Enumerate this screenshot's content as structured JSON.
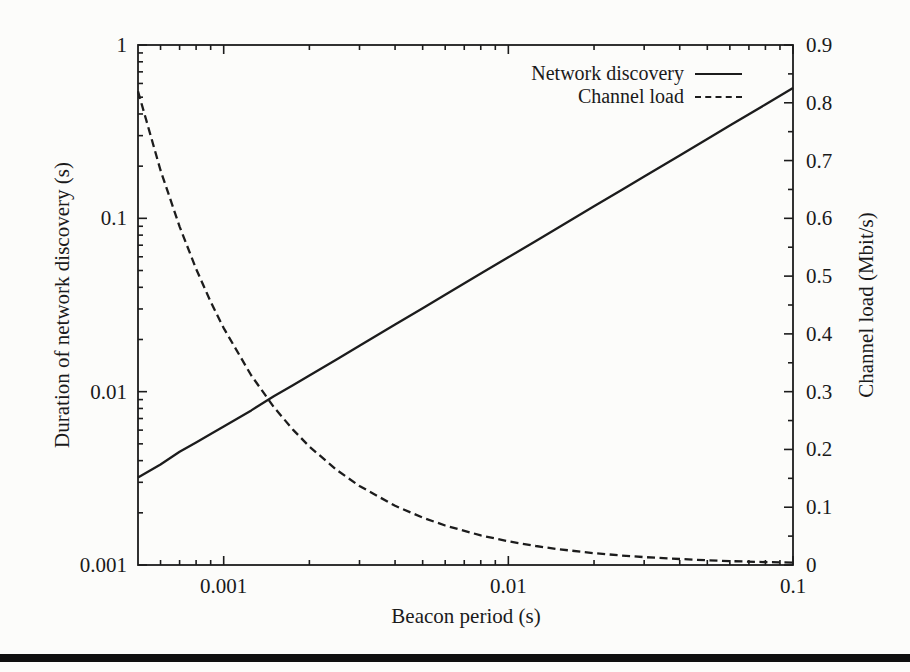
{
  "page": {
    "background": "#fcfcfa",
    "bottom_rule_color": "#0f0f0f",
    "line_color": "#1c1c1c"
  },
  "chart_data": {
    "type": "line",
    "title": "",
    "xlabel": "Beacon period (s)",
    "ylabel_left": "Duration of network discovery (s)",
    "ylabel_right": "Channel load (Mbit/s)",
    "x_scale": "log",
    "y_left_scale": "log",
    "y_right_scale": "linear",
    "xlim": [
      0.0005,
      0.1
    ],
    "ylim_left": [
      0.001,
      1
    ],
    "ylim_right": [
      0,
      0.9
    ],
    "x_ticks": [
      0.001,
      0.01,
      0.1
    ],
    "x_tick_labels": [
      "0.001",
      "0.01",
      "0.1"
    ],
    "y_left_ticks": [
      1,
      0.1,
      0.01,
      0.001
    ],
    "y_left_tick_labels": [
      "1",
      "0.1",
      "0.01",
      "0.001"
    ],
    "y_right_ticks": [
      0.9,
      0.8,
      0.7,
      0.6,
      0.5,
      0.4,
      0.3,
      0.2,
      0.1,
      0
    ],
    "y_right_tick_labels": [
      "0.9",
      "0.8",
      "0.7",
      "0.6",
      "0.5",
      "0.4",
      "0.3",
      "0.2",
      "0.1",
      "0"
    ],
    "grid": false,
    "legend_position": "top-right-inside",
    "series": [
      {
        "name": "Network discovery",
        "axis": "left",
        "style": "solid",
        "x": [
          0.0005,
          0.0006,
          0.0007,
          0.0008,
          0.0009,
          0.001,
          0.00125,
          0.0015,
          0.00175,
          0.002,
          0.0025,
          0.003,
          0.004,
          0.005,
          0.006,
          0.008,
          0.01,
          0.0125,
          0.015,
          0.02,
          0.025,
          0.03,
          0.04,
          0.05,
          0.06,
          0.08,
          0.1
        ],
        "y": [
          0.0032,
          0.0038,
          0.0045,
          0.0051,
          0.0057,
          0.0063,
          0.0078,
          0.0094,
          0.0109,
          0.0124,
          0.0154,
          0.0184,
          0.0244,
          0.0303,
          0.0362,
          0.048,
          0.0596,
          0.0741,
          0.0886,
          0.1173,
          0.1459,
          0.1743,
          0.2308,
          0.2869,
          0.3428,
          0.4539,
          0.5644
        ]
      },
      {
        "name": "Channel load",
        "axis": "right",
        "style": "dashed",
        "x": [
          0.0005,
          0.0006,
          0.0007,
          0.0008,
          0.0009,
          0.001,
          0.00125,
          0.0015,
          0.00175,
          0.002,
          0.0025,
          0.003,
          0.004,
          0.005,
          0.006,
          0.008,
          0.01,
          0.0125,
          0.015,
          0.02,
          0.025,
          0.03,
          0.04,
          0.05,
          0.06,
          0.08,
          0.1
        ],
        "y": [
          0.82,
          0.6833,
          0.5857,
          0.5125,
          0.4556,
          0.41,
          0.328,
          0.2733,
          0.2343,
          0.205,
          0.164,
          0.1367,
          0.1025,
          0.082,
          0.0683,
          0.0513,
          0.041,
          0.0328,
          0.0273,
          0.0205,
          0.0164,
          0.0137,
          0.0103,
          0.0082,
          0.0068,
          0.0051,
          0.0041
        ]
      }
    ]
  }
}
